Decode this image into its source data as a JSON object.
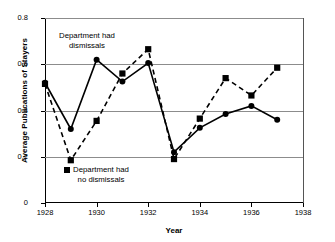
{
  "chart_data": {
    "type": "line",
    "title": "",
    "xlabel": "Year",
    "ylabel": "Average Publications of Stayers",
    "x": [
      1928,
      1929,
      1930,
      1931,
      1932,
      1933,
      1934,
      1935,
      1936,
      1937
    ],
    "xlim": [
      1928,
      1938
    ],
    "ylim": [
      0,
      0.8
    ],
    "xticks": [
      1928,
      1930,
      1932,
      1934,
      1936,
      1938
    ],
    "xtick_labels": [
      "1928",
      "1930",
      "1932",
      "1934",
      "1936",
      "1938"
    ],
    "yticks": [
      0,
      0.2,
      0.4,
      0.6,
      0.8
    ],
    "ytick_labels": [
      "0",
      "0.2",
      "0.4",
      "0.6",
      "0.8"
    ],
    "grid": "horizontal",
    "legend_position": "inline-annotations",
    "series": [
      {
        "name": "Department had dismissals",
        "style": "solid",
        "marker": "circle",
        "color": "#000000",
        "values": [
          0.52,
          0.32,
          0.62,
          0.525,
          0.605,
          0.22,
          0.325,
          0.385,
          0.42,
          0.36
        ]
      },
      {
        "name": "Department had no dismissals",
        "style": "dashed",
        "marker": "square",
        "color": "#000000",
        "values": [
          0.515,
          0.185,
          0.355,
          0.56,
          0.665,
          0.19,
          0.365,
          0.54,
          0.465,
          0.585
        ]
      }
    ],
    "annotations": [
      {
        "text_line1": "Department had",
        "text_line2": "dismissals",
        "series": "Department had dismissals"
      },
      {
        "text_line1": "Department had",
        "text_line2": "no dismissals",
        "series": "Department had no dismissals"
      }
    ]
  },
  "axes": {
    "y_title": "Average Publications of Stayers",
    "x_title": "Year"
  },
  "annotations": {
    "dismissals": {
      "line1": "Department had",
      "line2": "dismissals"
    },
    "no_dismissals": {
      "line1": "Department had",
      "line2": "no dismissals"
    }
  }
}
